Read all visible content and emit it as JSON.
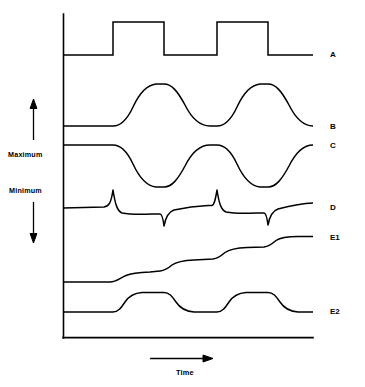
{
  "figure": {
    "type": "waveform-timing-diagram",
    "background_color": "#ffffff",
    "line_color": "#000000"
  },
  "axes": {
    "vertical": {
      "name": "amplitude-axis",
      "top_label": "Maximum",
      "bottom_label": "Minimum",
      "up_arrow": "up-arrow",
      "down_arrow": "down-arrow",
      "x": 63,
      "y_top": 14,
      "y_bottom": 338
    },
    "horizontal": {
      "name": "time-axis",
      "label": "Time",
      "arrow": "right-arrow",
      "y": 338,
      "x_left": 63,
      "x_right": 313
    }
  },
  "traces": [
    {
      "id": "A",
      "label": "A",
      "shape": "square-wave",
      "description": "Rectangular pulse train, two full pulses, instantaneous rising and falling edges",
      "baseline_y": 55,
      "peak_y": 22,
      "edges_x": [
        113,
        164,
        217,
        268
      ]
    },
    {
      "id": "B",
      "label": "B",
      "shape": "exponential-rise-decay",
      "description": "Smooth exponential rise to plateau at each rising edge, exponential decay back to baseline after each falling edge",
      "baseline_y": 126,
      "peak_y": 84,
      "edges_x": [
        113,
        164,
        217,
        268
      ]
    },
    {
      "id": "C",
      "label": "C",
      "shape": "inverted-exponential-rise-decay",
      "description": "Mirror image of trace B; smooth exponential fall to trough at each rising edge, exponential recovery to baseline after each falling edge",
      "baseline_y": 145,
      "trough_y": 186,
      "edges_x": [
        113,
        164,
        217,
        268
      ]
    },
    {
      "id": "D",
      "label": "D",
      "shape": "derivative-spikes",
      "description": "Sharp positive spike at each rising edge and sharp negative spike at each falling edge, with slow relaxation between; baseline drifts slightly upward over time",
      "baseline_y": 207,
      "positive_spike_y": 190,
      "negative_spike_y": 225,
      "edges_x": [
        113,
        164,
        217,
        268
      ]
    },
    {
      "id": "E1",
      "label": "E1",
      "shape": "monotonic-staircase",
      "description": "Cumulative staircase rising in four smoothed steps, never decreasing",
      "baseline_y": 282,
      "final_y": 238,
      "edges_x": [
        113,
        164,
        217,
        268
      ],
      "step_count": 4
    },
    {
      "id": "E2",
      "label": "E2",
      "shape": "rounded-pulse-wave",
      "description": "Pulse train with rounded rising and falling edges, two full pulses returning to baseline",
      "baseline_y": 312,
      "peak_y": 292,
      "edges_x": [
        113,
        164,
        217,
        268
      ]
    }
  ]
}
